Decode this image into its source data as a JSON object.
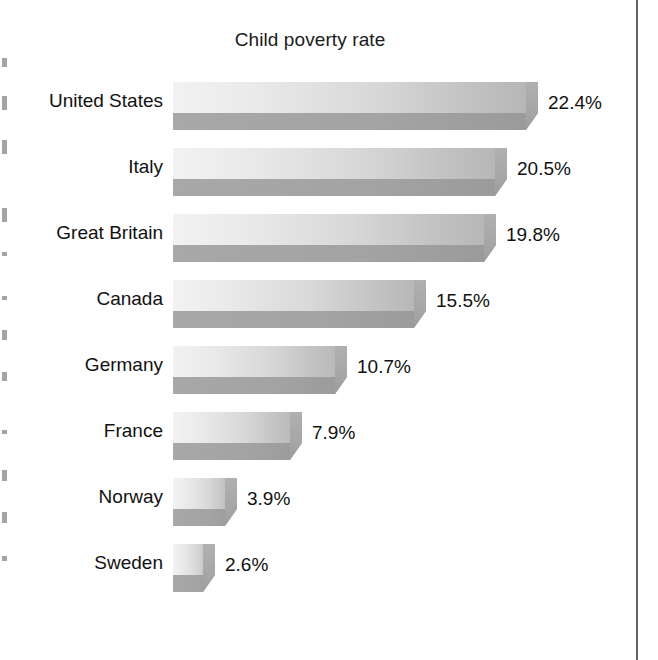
{
  "chart_data": {
    "type": "bar",
    "orientation": "horizontal",
    "title": "Child poverty rate",
    "xlabel": "",
    "ylabel": "",
    "grid": false,
    "legend": null,
    "value_suffix": "%",
    "xlim": [
      0,
      22.4
    ],
    "categories": [
      "United States",
      "Italy",
      "Great Britain",
      "Canada",
      "Germany",
      "France",
      "Norway",
      "Sweden"
    ],
    "values": [
      22.4,
      20.5,
      19.8,
      15.5,
      10.7,
      7.9,
      3.9,
      2.6
    ],
    "value_labels": [
      "22.4%",
      "20.5%",
      "19.8%",
      "15.5%",
      "10.7%",
      "7.9%",
      "3.9%",
      "2.6%"
    ],
    "bars": [
      {
        "category": "United States",
        "value": 22.4,
        "label": "22.4%"
      },
      {
        "category": "Italy",
        "value": 20.5,
        "label": "20.5%"
      },
      {
        "category": "Great Britain",
        "value": 19.8,
        "label": "19.8%"
      },
      {
        "category": "Canada",
        "value": 15.5,
        "label": "15.5%"
      },
      {
        "category": "Germany",
        "value": 10.7,
        "label": "10.7%"
      },
      {
        "category": "France",
        "value": 7.9,
        "label": "7.9%"
      },
      {
        "category": "Norway",
        "value": 3.9,
        "label": "3.9%"
      },
      {
        "category": "Sweden",
        "value": 2.6,
        "label": "2.6%"
      }
    ],
    "colors": {
      "bar_top_light": "#f2f2f2",
      "bar_top_dark": "#b4b4b4",
      "bar_bottom": "#a3a3a3",
      "bar_cap": "#a6a6a6",
      "text": "#111111",
      "background": "#ffffff",
      "page_rule": "#4a4a4a"
    }
  },
  "layout": {
    "bar_left_px": 173,
    "first_row_top_px": 82,
    "row_pitch_px": 66,
    "px_per_unit": 16.3,
    "label_gap_px": 10
  }
}
